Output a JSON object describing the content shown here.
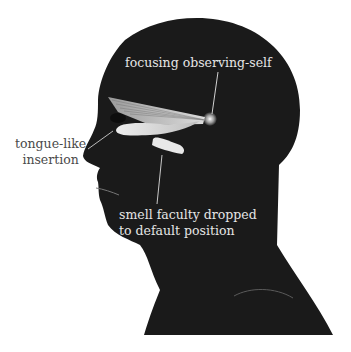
{
  "figure": {
    "colors": {
      "background": "#ffffff",
      "silhouette": "#1a1a1a",
      "highlight": "#e8e8e8",
      "label_dark": "#4a4a4a",
      "label_light": "#e6e6e6"
    }
  },
  "labels": {
    "focus": "focusing observing-self",
    "tongue_line1": "tongue-like",
    "tongue_line2": "insertion",
    "smell_line1": "smell faculty dropped",
    "smell_line2": "to default position"
  }
}
